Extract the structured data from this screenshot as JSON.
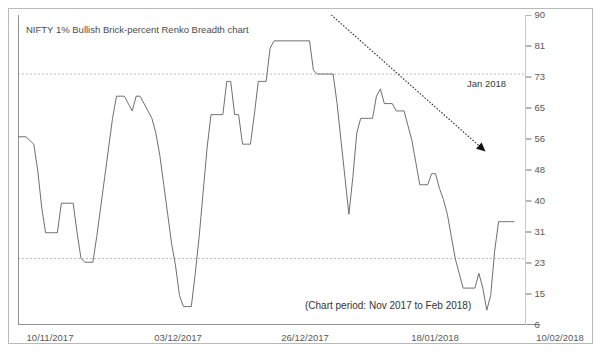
{
  "chart_data": {
    "type": "line",
    "title": "NIFTY 1% Bullish Brick-percent Renko Breadth chart",
    "subtitle": "(Chart period: Nov 2017 to Feb 2018)",
    "xlabel": "",
    "ylabel": "",
    "ylim": [
      6,
      90
    ],
    "xlim": [
      0,
      100
    ],
    "grid": "horizontal-dashed",
    "legend": "none",
    "y_ticks": [
      90,
      81,
      73,
      65,
      56,
      48,
      40,
      31,
      23,
      15,
      6
    ],
    "x_ticks": [
      "10/11/2017",
      "03/12/2017",
      "26/12/2017",
      "18/01/2018",
      "10/02/2018"
    ],
    "x_tick_positions": [
      6.2,
      30.7,
      55.0,
      79.9,
      103.8
    ],
    "gridline_values": [
      74,
      24
    ],
    "annotations": [
      {
        "text": "Jan 2018",
        "type": "arrow-label",
        "arrow_from": [
          60.2,
          93.5
        ],
        "arrow_to": [
          94.2,
          53.0
        ],
        "style": "dotted-with-arrowhead"
      }
    ],
    "series": [
      {
        "name": "1% Bullish Brick-percent",
        "color": "#6e6f71",
        "x": [
          0.0,
          1.1,
          2.2,
          3.3,
          4.3,
          5.4,
          6.5,
          7.6,
          8.6,
          9.7,
          10.8,
          11.9,
          12.9,
          14.0,
          15.1,
          16.1,
          17.2,
          18.3,
          19.4,
          20.4,
          21.5,
          22.6,
          23.7,
          24.7,
          25.8,
          26.9,
          28.0,
          29.0,
          30.1,
          31.2,
          32.3,
          33.3,
          34.4,
          35.5,
          36.6,
          37.6,
          38.7,
          39.8,
          40.9,
          41.9,
          43.0,
          44.1,
          45.2,
          46.2,
          47.3,
          48.4,
          49.5,
          50.5,
          51.6,
          52.7,
          53.8,
          54.8,
          55.9,
          57.0,
          58.1,
          59.1,
          60.2,
          61.3,
          62.4,
          63.4,
          64.5,
          65.6,
          66.7,
          67.7,
          68.8,
          69.9,
          71.0,
          72.0,
          73.1,
          74.2,
          75.3,
          76.3,
          77.4,
          78.5,
          79.6,
          80.6,
          81.7,
          82.8,
          83.9,
          84.9,
          86.0,
          87.1,
          88.2,
          89.2,
          90.3,
          91.4,
          92.5,
          93.5,
          94.6,
          95.7,
          96.8,
          97.8,
          98.9,
          100.0
        ],
        "values": [
          57,
          57,
          57,
          56,
          55,
          48,
          38,
          31,
          31,
          31,
          31,
          39,
          39,
          39,
          39,
          31,
          24,
          23,
          23,
          23,
          30,
          38,
          46,
          54,
          62,
          68,
          68,
          68,
          66,
          64,
          68,
          68,
          66,
          64,
          62,
          58,
          52,
          44,
          36,
          28,
          22,
          14,
          11,
          11,
          11,
          20,
          30,
          42,
          54,
          63,
          63,
          63,
          63,
          72,
          72,
          63,
          63,
          55,
          55,
          55,
          63,
          72,
          72,
          72,
          81,
          83,
          83,
          83,
          83,
          83,
          83,
          83,
          83,
          83,
          83,
          75,
          74,
          74,
          74,
          74,
          74,
          66,
          56,
          46,
          36,
          46,
          58,
          62,
          62,
          62,
          62,
          68,
          70,
          66
        ],
        "values_continued": [
          66,
          66,
          64,
          64,
          64,
          60,
          56,
          50,
          44,
          44,
          44,
          47,
          47,
          43,
          40,
          36,
          30,
          24,
          20,
          16,
          16,
          16,
          16,
          20,
          16,
          10,
          14,
          26,
          34,
          34,
          34,
          34,
          34
        ]
      }
    ]
  },
  "y_axis": {
    "tick_labels": [
      "90",
      "81",
      "73",
      "65",
      "56",
      "48",
      "40",
      "31",
      "23",
      "15",
      "6"
    ],
    "tick_y_px": [
      15,
      46,
      77,
      108,
      139,
      170,
      201,
      232,
      263,
      294,
      325
    ]
  },
  "x_axis": {
    "tick_labels": [
      "10/11/2017",
      "03/12/2017",
      "26/12/2017",
      "18/01/2018",
      "10/02/2018"
    ],
    "tick_x_px": [
      50,
      178,
      305,
      435,
      560
    ]
  },
  "title": {
    "text": "NIFTY 1% Bullish Brick-percent Renko Breadth chart"
  },
  "note": {
    "text": "(Chart period: Nov 2017 to Feb 2018)"
  },
  "arrow_annotation": {
    "label": "Jan 2018"
  },
  "colors": {
    "line": "#6e6f71",
    "axis": "#9a9a9c",
    "gridline": "#a8a8aa",
    "frame": "#b9b9b9",
    "text": "#4a4b4d"
  }
}
